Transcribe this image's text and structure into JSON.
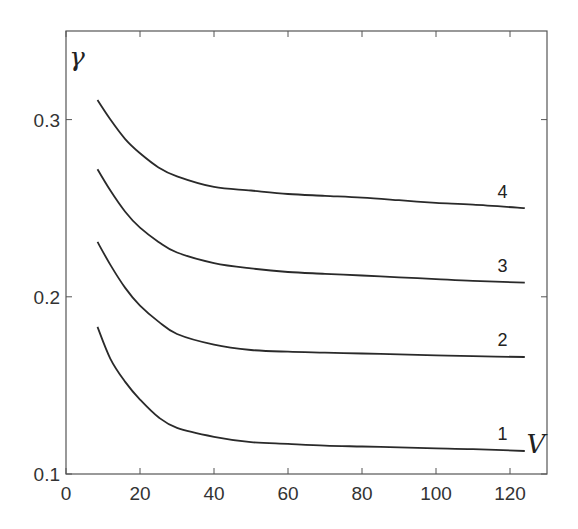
{
  "chart_data": {
    "type": "line",
    "title": "",
    "xlabel": "V",
    "ylabel": "γ",
    "xlim": [
      0,
      130
    ],
    "ylim": [
      0.1,
      0.35
    ],
    "xticks": [
      0,
      20,
      40,
      60,
      80,
      100,
      120
    ],
    "xtick_labels": [
      "0",
      "20",
      "40",
      "60",
      "80",
      "100",
      "120"
    ],
    "yticks": [
      0.1,
      0.2,
      0.3
    ],
    "ytick_labels": [
      "0.1",
      "0.2",
      "0.3"
    ],
    "grid": false,
    "legend": "inline curve labels at right end",
    "series": [
      {
        "name": "1",
        "x": [
          8.5,
          12,
          16,
          20,
          25,
          30,
          40,
          50,
          60,
          70,
          80,
          90,
          100,
          110,
          124
        ],
        "y": [
          0.183,
          0.165,
          0.152,
          0.142,
          0.132,
          0.126,
          0.121,
          0.118,
          0.117,
          0.116,
          0.1155,
          0.115,
          0.1145,
          0.114,
          0.113
        ]
      },
      {
        "name": "2",
        "x": [
          8.5,
          12,
          16,
          20,
          25,
          30,
          40,
          50,
          60,
          70,
          80,
          90,
          100,
          110,
          124
        ],
        "y": [
          0.231,
          0.218,
          0.205,
          0.195,
          0.186,
          0.179,
          0.173,
          0.17,
          0.169,
          0.1685,
          0.168,
          0.1675,
          0.167,
          0.1665,
          0.166
        ]
      },
      {
        "name": "3",
        "x": [
          8.5,
          12,
          16,
          20,
          25,
          30,
          40,
          50,
          60,
          70,
          80,
          90,
          100,
          110,
          124
        ],
        "y": [
          0.272,
          0.26,
          0.248,
          0.239,
          0.231,
          0.225,
          0.219,
          0.216,
          0.214,
          0.213,
          0.212,
          0.211,
          0.21,
          0.209,
          0.208
        ]
      },
      {
        "name": "4",
        "x": [
          8.5,
          12,
          16,
          20,
          25,
          30,
          40,
          50,
          60,
          70,
          80,
          90,
          100,
          110,
          124
        ],
        "y": [
          0.311,
          0.3,
          0.289,
          0.281,
          0.273,
          0.268,
          0.262,
          0.26,
          0.258,
          0.257,
          0.256,
          0.2545,
          0.253,
          0.252,
          0.25
        ]
      }
    ],
    "annotations": [
      {
        "text": "1",
        "x": 118,
        "y": 0.119
      },
      {
        "text": "2",
        "x": 118,
        "y": 0.172
      },
      {
        "text": "3",
        "x": 118,
        "y": 0.214
      },
      {
        "text": "4",
        "x": 118,
        "y": 0.256
      },
      {
        "text": "V",
        "x": 127,
        "y": 0.112
      },
      {
        "text": "γ",
        "x": 3,
        "y": 0.33
      }
    ]
  },
  "colors": {
    "axis": "#555555",
    "curve": "#2a2a2a",
    "text": "#333333"
  }
}
